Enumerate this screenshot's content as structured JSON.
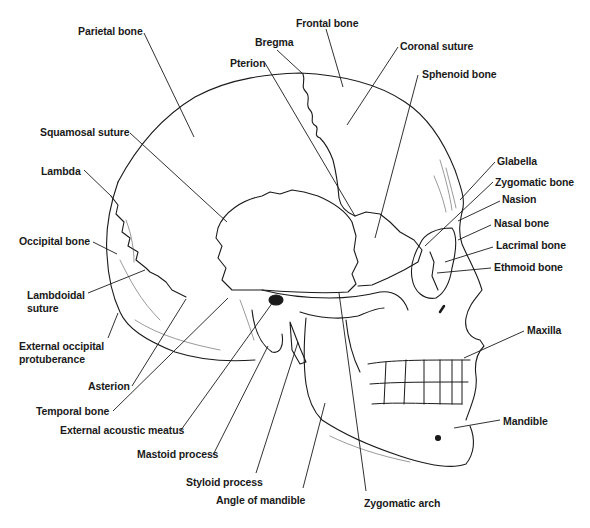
{
  "diagram": {
    "type": "anatomical-illustration",
    "line_color": "#1a1a1a",
    "background": "#ffffff"
  },
  "labels": [
    {
      "id": "parietal-bone",
      "text": "Parietal bone",
      "x": 78,
      "y": 25
    },
    {
      "id": "frontal-bone",
      "text": "Frontal bone",
      "x": 296,
      "y": 17
    },
    {
      "id": "bregma",
      "text": "Bregma",
      "x": 255,
      "y": 36
    },
    {
      "id": "coronal-suture",
      "text": "Coronal suture",
      "x": 400,
      "y": 40
    },
    {
      "id": "pterion",
      "text": "Pterion",
      "x": 230,
      "y": 57
    },
    {
      "id": "sphenoid-bone",
      "text": "Sphenoid bone",
      "x": 422,
      "y": 68
    },
    {
      "id": "squamosal-suture",
      "text": "Squamosal suture",
      "x": 40,
      "y": 126
    },
    {
      "id": "lambda",
      "text": "Lambda",
      "x": 41,
      "y": 165
    },
    {
      "id": "glabella",
      "text": "Glabella",
      "x": 497,
      "y": 155
    },
    {
      "id": "zygomatic-bone",
      "text": "Zygomatic bone",
      "x": 495,
      "y": 176
    },
    {
      "id": "nasion",
      "text": "Nasion",
      "x": 502,
      "y": 193
    },
    {
      "id": "nasal-bone",
      "text": "Nasal bone",
      "x": 494,
      "y": 217
    },
    {
      "id": "occipital-bone",
      "text": "Occipital bone",
      "x": 19,
      "y": 235
    },
    {
      "id": "lacrimal-bone",
      "text": "Lacrimal bone",
      "x": 496,
      "y": 239
    },
    {
      "id": "ethmoid-bone",
      "text": "Ethmoid bone",
      "x": 494,
      "y": 261
    },
    {
      "id": "lambdoidal-suture",
      "text": "Lambdoidal suture",
      "x": 27,
      "y": 289,
      "multiline": true
    },
    {
      "id": "external-occipital-protuberance",
      "text": "External occipital protuberance",
      "x": 19,
      "y": 340,
      "multiline": true
    },
    {
      "id": "maxilla",
      "text": "Maxilla",
      "x": 527,
      "y": 324
    },
    {
      "id": "asterion",
      "text": "Asterion",
      "x": 88,
      "y": 380
    },
    {
      "id": "temporal-bone",
      "text": "Temporal bone",
      "x": 36,
      "y": 405
    },
    {
      "id": "external-acoustic-meatus",
      "text": "External acoustic meatus",
      "x": 60,
      "y": 424
    },
    {
      "id": "mandible",
      "text": "Mandible",
      "x": 503,
      "y": 415
    },
    {
      "id": "mastoid-process",
      "text": "Mastoid process",
      "x": 137,
      "y": 448
    },
    {
      "id": "styloid-process",
      "text": "Styloid process",
      "x": 186,
      "y": 476
    },
    {
      "id": "angle-of-mandible",
      "text": "Angle of mandible",
      "x": 216,
      "y": 494
    },
    {
      "id": "zygomatic-arch",
      "text": "Zygomatic arch",
      "x": 364,
      "y": 497
    }
  ],
  "leaders": [
    {
      "id": "parietal-bone",
      "points": "144,33 194,137"
    },
    {
      "id": "frontal-bone",
      "points": "326,29 343,87"
    },
    {
      "id": "bregma",
      "points": "277,50 303,74"
    },
    {
      "id": "coronal-suture",
      "points": "398,47 347,125"
    },
    {
      "id": "pterion",
      "points": "265,63 355,216"
    },
    {
      "id": "sphenoid-bone",
      "points": "418,75 375,238"
    },
    {
      "id": "squamosal-suture",
      "points": "130,133 227,222"
    },
    {
      "id": "lambda",
      "points": "84,170 111,196"
    },
    {
      "id": "glabella",
      "points": "495,162 460,200"
    },
    {
      "id": "zygomatic-bone",
      "points": "493,182 425,246"
    },
    {
      "id": "nasion",
      "points": "500,201 458,221"
    },
    {
      "id": "nasal-bone",
      "points": "491,225 458,240"
    },
    {
      "id": "occipital-bone",
      "points": "93,242 117,254"
    },
    {
      "id": "lacrimal-bone",
      "points": "493,247 445,262"
    },
    {
      "id": "ethmoid-bone",
      "points": "491,268 437,273"
    },
    {
      "id": "lambdoidal-suture",
      "points": "88,293 145,270"
    },
    {
      "id": "external-occipital-protuberance",
      "points": "108,338 118,313"
    },
    {
      "id": "maxilla",
      "points": "524,331 464,358"
    },
    {
      "id": "asterion",
      "points": "132,386 186,299"
    },
    {
      "id": "temporal-bone",
      "points": "113,411 228,298"
    },
    {
      "id": "external-acoustic-meatus",
      "points": "181,430 273,302"
    },
    {
      "id": "mandible",
      "points": "500,420 454,428"
    },
    {
      "id": "mastoid-process",
      "points": "213,455 268,346"
    },
    {
      "id": "styloid-process",
      "points": "256,473 298,342"
    },
    {
      "id": "angle-of-mandible",
      "points": "303,488 325,403"
    },
    {
      "id": "zygomatic-arch",
      "points": "366,491 339,293"
    }
  ]
}
